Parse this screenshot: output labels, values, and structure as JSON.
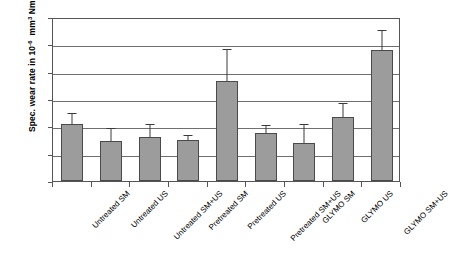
{
  "chart_data": {
    "type": "bar",
    "title": "",
    "xlabel": "",
    "ylabel": "Spec. wear rate in 10-6  mm3 Nm-1",
    "ylabel_parts": {
      "prefix": "Spec. wear rate in 10",
      "exp1": "-6",
      "mid": "mm",
      "exp2": "3",
      "unit": "Nm",
      "exp3": "-1"
    },
    "ylim": [
      0,
      3
    ],
    "ytick_labels": [
      "0",
      "0.5",
      "1",
      "1.5",
      "2",
      "2.5",
      "3"
    ],
    "ytick_values": [
      0,
      0.5,
      1,
      1.5,
      2,
      2.5,
      3
    ],
    "grid": true,
    "legend": "none",
    "categories": [
      "Untreated SM",
      "Untreated US",
      "Untreated SM+US",
      "Pretreated SM",
      "Pretreated US",
      "Pretreated SM+US",
      "GLYMO SM",
      "GLYMO US",
      "GLYMO SM+US"
    ],
    "values": [
      1.05,
      0.73,
      0.8,
      0.75,
      1.83,
      0.88,
      0.7,
      1.17,
      2.4
    ],
    "errors": [
      0.17,
      0.22,
      0.22,
      0.07,
      0.57,
      0.13,
      0.32,
      0.23,
      0.35
    ],
    "bar_color": "#9c9c9c",
    "bar_edge_color": "#4a4a4a",
    "grid_color": "#6f6f6f",
    "axis_color": "#555555",
    "background": "#ffffff"
  }
}
